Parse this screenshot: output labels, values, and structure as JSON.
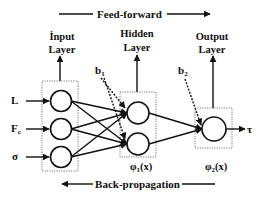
{
  "title": {
    "feed_forward": "Feed-forward",
    "back_propagation": "Back-propagation"
  },
  "layers": {
    "input": {
      "line1": "İnput",
      "line2": "Layer"
    },
    "hidden": {
      "line1": "Hidden",
      "line2": "Layer",
      "activation_base": "φ",
      "activation_sub": "1",
      "activation_arg": "(x)"
    },
    "output": {
      "line1": "Output",
      "line2": "Layer",
      "activation_base": "φ",
      "activation_sub": "2",
      "activation_arg": "(x)"
    }
  },
  "inputs": [
    {
      "base": "L",
      "sub": ""
    },
    {
      "base": "F",
      "sub": "c"
    },
    {
      "base": "σ",
      "sub": ""
    }
  ],
  "biases": [
    {
      "base": "b",
      "sub": "1"
    },
    {
      "base": "b",
      "sub": "2"
    }
  ],
  "output_symbol": "τ",
  "colors": {
    "ink": "#111111",
    "box_border": "#555555",
    "background": "#ffffff"
  }
}
